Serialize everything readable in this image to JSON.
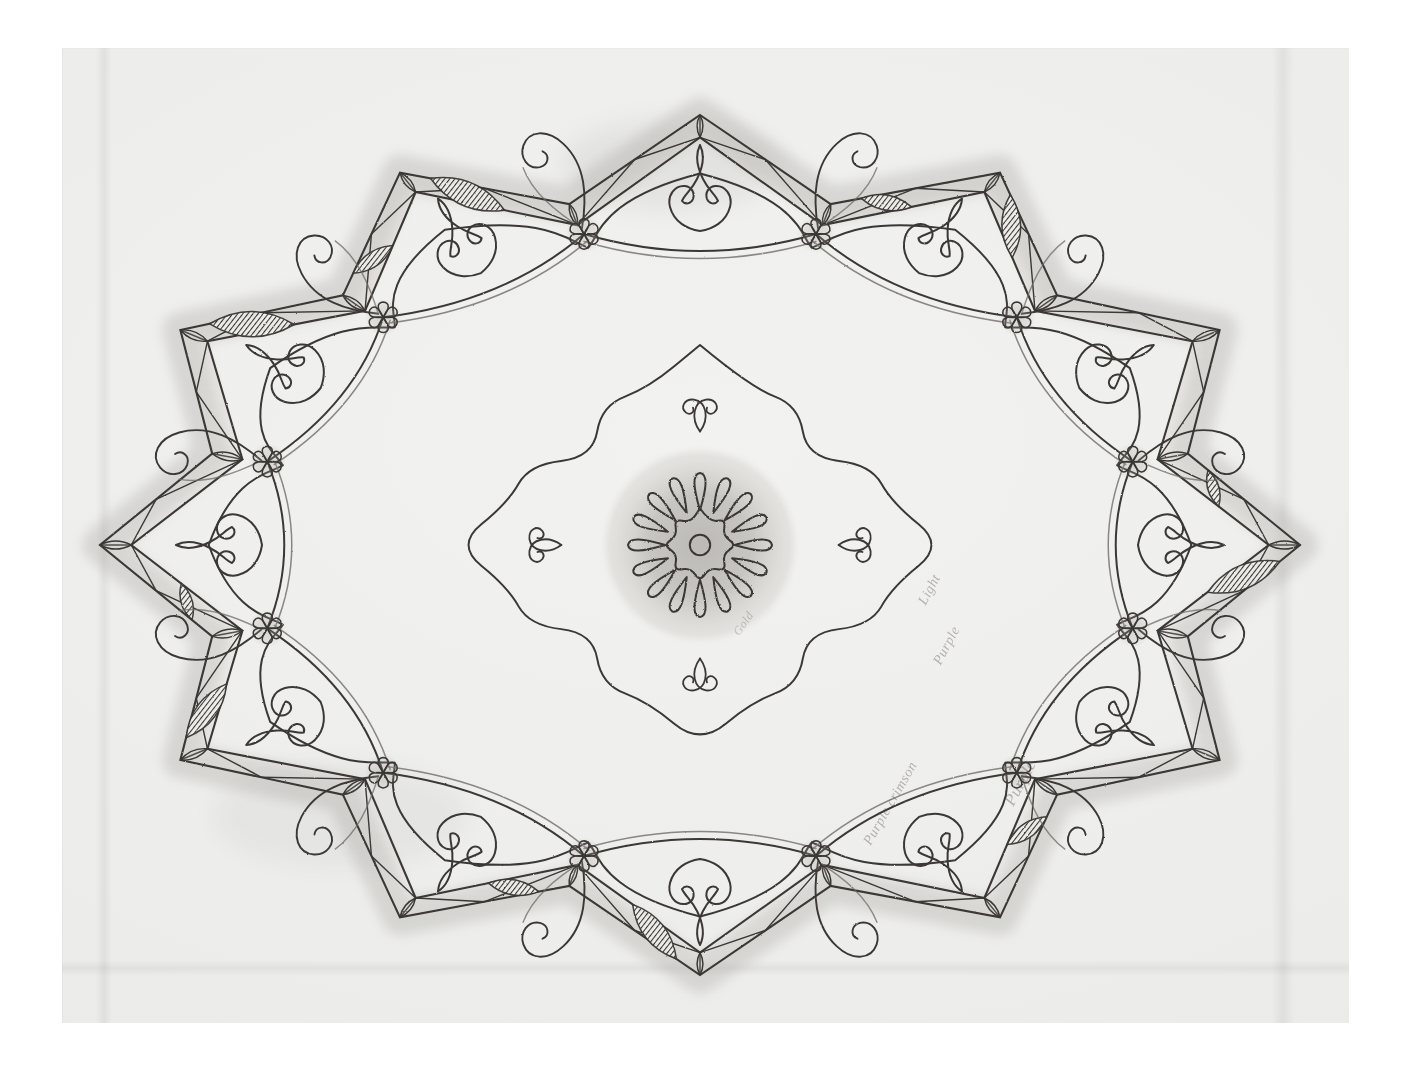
{
  "document": {
    "kind": "pencil-drawing",
    "title": "Ornamental Design for a Ceiling or Tray",
    "medium": "graphite on laid paper",
    "support_color": "#ececea",
    "background_color": "#ffffff",
    "line_color": "#3a3734",
    "shadow_color": "#8e8b86"
  },
  "annotations": [
    {
      "id": "note-1",
      "text": "Light",
      "note": "faint pencil inscription, rotated"
    },
    {
      "id": "note-2",
      "text": "Purple",
      "note": "faint pencil inscription, rotated"
    },
    {
      "id": "note-3",
      "text": "Purple crimson",
      "note": "faint pencil inscription, rotated"
    },
    {
      "id": "note-4",
      "text": "Purple",
      "note": "faint pencil inscription, rotated"
    },
    {
      "id": "note-5",
      "text": "Gold",
      "note": "faint pencil inscription, rotated"
    }
  ],
  "ornament": {
    "center_rosette": {
      "name": "central-rosette",
      "outer_petals": 16,
      "inner_petals": 8,
      "center_dot": 1,
      "outer_radius": 72,
      "inner_radius": 34,
      "cx": 700,
      "cy": 545
    },
    "garland": {
      "name": "rosette-garland-swags",
      "swag_count": 12,
      "rosette_count": 12,
      "rosette_petals": 6,
      "rosette_radius": 15
    },
    "arcade": {
      "name": "ogee-arch-band",
      "arch_count": 12
    },
    "cartouche": {
      "name": "central-quatrefoil-cartouche",
      "lobes": 4
    },
    "border": {
      "name": "stepped-star-border",
      "points": 12,
      "band_width": 34,
      "leaf_motif_count": 40,
      "shaded_leaf_count": 14
    }
  },
  "palette": {
    "paper": "#ececea",
    "paper_light": "#f2f2f0",
    "paper_dark": "#e2e2df",
    "graphite": "#3a3734",
    "graphite_soft": "#6f6b66",
    "graphite_wash": "#a9a5a0",
    "white": "#ffffff"
  }
}
